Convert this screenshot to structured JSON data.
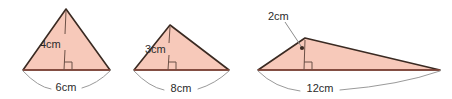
{
  "figure": {
    "background_color": "#ffffff",
    "fill_color": "#f7c9ba",
    "outline_color": "#3a2a22",
    "base_line_color": "#8c4a3c",
    "arc_color": "#9a9a9a",
    "leader_color": "#8c8c8c",
    "height_line_color": "#6b5046",
    "text_color": "#2b2b2b"
  },
  "triangles": [
    {
      "name": "triangle-1",
      "height_label": "4cm",
      "base_label": "6cm",
      "height_value": 4,
      "base_value": 6,
      "unit": "cm",
      "height_label_position": "inside-left-of-height-line",
      "base_label_position": "below-base-arc"
    },
    {
      "name": "triangle-2",
      "height_label": "3cm",
      "base_label": "8cm",
      "height_value": 3,
      "base_value": 8,
      "unit": "cm",
      "height_label_position": "inside-left-of-height-line",
      "base_label_position": "below-base-arc"
    },
    {
      "name": "triangle-3",
      "height_label": "2cm",
      "base_label": "12cm",
      "height_value": 2,
      "base_value": 12,
      "unit": "cm",
      "height_label_position": "outside-upper-left-with-leader",
      "base_label_position": "below-base-arc"
    }
  ]
}
